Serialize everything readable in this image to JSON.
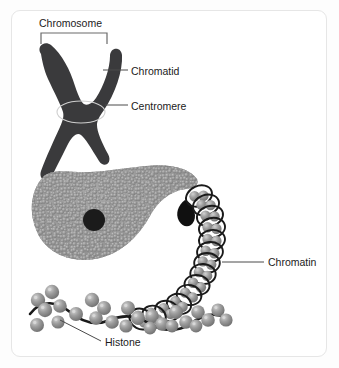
{
  "figure": {
    "background_color": "#fdfdfd",
    "card_color": "#ffffff",
    "card_border_color": "#e6e6e6"
  },
  "labels": {
    "chromosome": "Chromosome",
    "chromatid": "Chromatid",
    "centromere": "Centromere",
    "chromatin": "Chromatin",
    "histone": "Histone"
  },
  "colors": {
    "chromosome_body": "#3a3a3c",
    "chromatin_bead": "#9a9a9a",
    "chromatin_bead_dark": "#7d7d7d",
    "histone_bead": "#8f8f8f",
    "histone_bead_highlight": "#c9c9c9",
    "dna_strand": "#1a1a1a",
    "dark_blob": "#121212",
    "leader_line": "#4a4a4a",
    "text": "#1b1b1b"
  },
  "structures": {
    "chromosome_shape": "x-shaped-sister-chromatids",
    "centromere_marker": "ellipse-outline-at-crossing",
    "chromatin_blob": "teardrop-of-small-spheres-with-dark-core",
    "solenoid": "coiled-nucleosome-fiber",
    "beads_on_string": "histone-beads-on-dna-strand"
  },
  "leaders": {
    "chromatid": "horizontal-line-from-chromatid-arm",
    "centromere": "horizontal-line-from-centromere-ellipse",
    "chromatin": "horizontal-line-from-solenoid-coil",
    "histone": "diagonal-line-from-histone-bead"
  },
  "bracket": {
    "name": "chromosome-span-bracket",
    "orientation": "downward-tips"
  }
}
